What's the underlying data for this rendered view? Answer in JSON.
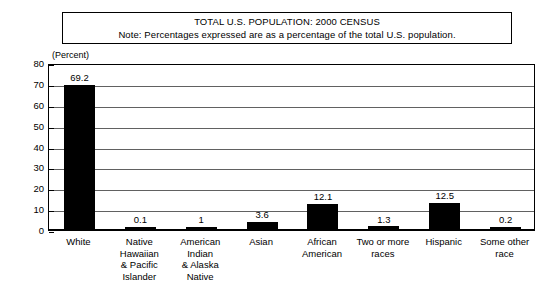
{
  "title_box": {
    "line1": "TOTAL U.S. POPULATION: 2000 CENSUS",
    "line2": "Note: Percentages expressed are as a percentage of the total U.S. population."
  },
  "axis_caption": "(Percent)",
  "chart_data": {
    "type": "bar",
    "title": "TOTAL U.S. POPULATION: 2000 CENSUS",
    "subtitle": "Note: Percentages expressed are as a percentage of the total U.S. population.",
    "xlabel": "",
    "ylabel": "(Percent)",
    "ylim": [
      0,
      80
    ],
    "yticks": [
      0,
      10,
      20,
      30,
      40,
      50,
      60,
      70,
      80
    ],
    "ytick_labels": [
      "0",
      "10",
      "20",
      "30",
      "40",
      "50",
      "60",
      "70",
      "80"
    ],
    "grid": true,
    "legend": false,
    "bar_color": "#000000",
    "categories": [
      "White",
      "Native Hawaiian & Pacific Islander",
      "American Indian & Alaska Native",
      "Asian",
      "African American",
      "Two or more races",
      "Hispanic",
      "Some other race"
    ],
    "category_label_lines": [
      [
        "White"
      ],
      [
        "Native",
        "Hawaiian",
        "& Pacific",
        "Islander"
      ],
      [
        "American",
        "Indian",
        "& Alaska",
        "Native"
      ],
      [
        "Asian"
      ],
      [
        "African",
        "American"
      ],
      [
        "Two or more",
        "races"
      ],
      [
        "Hispanic"
      ],
      [
        "Some other",
        "race"
      ]
    ],
    "values": [
      69.2,
      0.1,
      1,
      3.6,
      12.1,
      1.3,
      12.5,
      0.2
    ],
    "value_labels": [
      "69.2",
      "0.1",
      "1",
      "3.6",
      "12.1",
      "1.3",
      "12.5",
      "0.2"
    ]
  }
}
